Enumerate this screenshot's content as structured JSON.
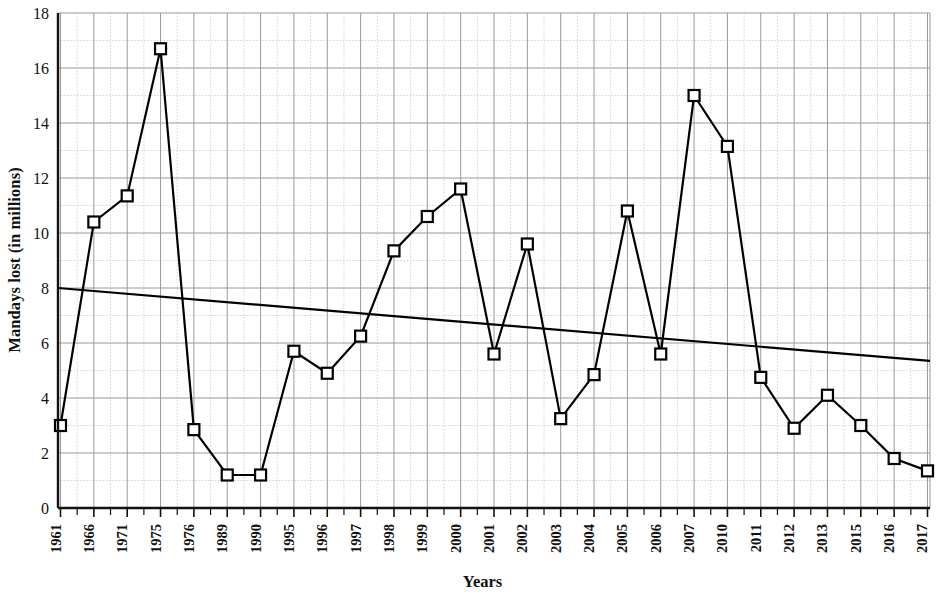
{
  "chart_data": {
    "type": "line",
    "title": "",
    "xlabel": "Years",
    "ylabel": "Mandays lost (in millions)",
    "categories": [
      "1961",
      "1966",
      "1971",
      "1975",
      "1976",
      "1989",
      "1990",
      "1995",
      "1996",
      "1997",
      "1998",
      "1999",
      "2000",
      "2001",
      "2002",
      "2003",
      "2004",
      "2005",
      "2006",
      "2007",
      "2010",
      "2011",
      "2012",
      "2013",
      "2015",
      "2016",
      "2017"
    ],
    "values": [
      3.0,
      10.4,
      11.35,
      16.7,
      2.85,
      1.2,
      1.2,
      5.7,
      4.9,
      6.25,
      9.35,
      10.6,
      11.6,
      5.6,
      9.6,
      3.25,
      4.85,
      10.8,
      5.6,
      15.0,
      13.15,
      4.75,
      2.9,
      4.1,
      3.0,
      1.8,
      1.35
    ],
    "series": [
      {
        "name": "Mandays lost",
        "marker": "open-square",
        "color": "#000000",
        "values": [
          3.0,
          10.4,
          11.35,
          16.7,
          2.85,
          1.2,
          1.2,
          5.7,
          4.9,
          6.25,
          9.35,
          10.6,
          11.6,
          5.6,
          9.6,
          3.25,
          4.85,
          10.8,
          5.6,
          15.0,
          13.15,
          4.75,
          2.9,
          4.1,
          3.0,
          1.8,
          1.35
        ]
      },
      {
        "name": "Trend line",
        "marker": "none",
        "color": "#000000",
        "trend_start": 8.0,
        "trend_end": 5.35
      }
    ],
    "ylim": [
      0,
      18
    ],
    "yticks": [
      0,
      2,
      4,
      6,
      8,
      10,
      12,
      14,
      16,
      18
    ],
    "ytick_labels": [
      "0",
      "2",
      "4",
      "6",
      "8",
      "10",
      "12",
      "14",
      "16",
      "18"
    ],
    "grid": true,
    "grid_color": "#9a9a9a",
    "minor_grid_color": "#c9c9c9",
    "legend": "none",
    "background": "#ffffff",
    "axis_color": "#111111"
  },
  "axes": {
    "y_title": "Mandays lost (in millions)",
    "x_title": "Years"
  }
}
